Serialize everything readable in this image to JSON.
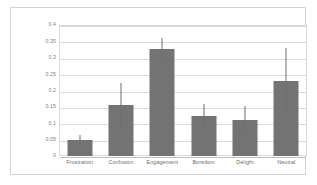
{
  "chart_data": {
    "type": "bar",
    "title": "",
    "xlabel": "",
    "ylabel": "",
    "categories": [
      "Frustration",
      "Confusion",
      "Engagement",
      "Boredom",
      "Delight",
      "Neutral"
    ],
    "values": [
      0.05,
      0.155,
      0.328,
      0.121,
      0.11,
      0.23
    ],
    "error_low": [
      0.035,
      0.09,
      0.29,
      0.084,
      0.068,
      0.132
    ],
    "error_high": [
      0.065,
      0.222,
      0.36,
      0.159,
      0.152,
      0.33
    ],
    "ylim": [
      0,
      0.4
    ],
    "ytick_labels": [
      "0",
      "0.05",
      "0.1",
      "0.15",
      "0.2",
      "0.25",
      "0.3",
      "0.35",
      "0.4"
    ],
    "ytick_values": [
      0,
      0.05,
      0.1,
      0.15,
      0.2,
      0.25,
      0.3,
      0.35,
      0.4
    ],
    "grid": true,
    "legend": "none",
    "bar_color": "#737373",
    "error_color": "#6e6e6e",
    "grid_color": "#d9d9d9",
    "axis_label_color": "#808080",
    "background_color": "#ffffff"
  }
}
